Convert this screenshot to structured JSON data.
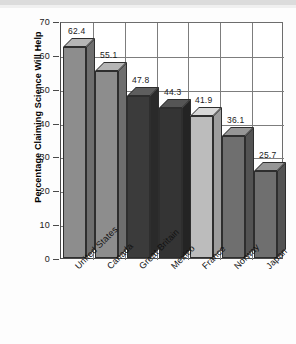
{
  "chart_data": {
    "type": "bar",
    "title": "",
    "xlabel": "",
    "ylabel": "Percentage  Claiming Science Will Help",
    "categories": [
      "United States",
      "Canada",
      "Great Britain",
      "Mexico",
      "France",
      "Norway",
      "Japan"
    ],
    "values": [
      62.4,
      55.1,
      47.8,
      44.3,
      41.9,
      36.1,
      25.7
    ],
    "value_labels": [
      "62.4",
      "55.1",
      "47.8",
      "44.3",
      "41.9",
      "36.1",
      "25.7"
    ],
    "ylim": [
      0,
      70
    ],
    "ytick_labels": [
      "0",
      "10",
      "20",
      "30",
      "40",
      "50",
      "60",
      "70"
    ],
    "ytick_values": [
      0,
      10,
      20,
      30,
      40,
      50,
      60,
      70
    ],
    "grid": "both",
    "legend": "none",
    "bar_colors": [
      "#8d8d8d",
      "#8d8d8d",
      "#3b3b3b",
      "#343434",
      "#bcbcbc",
      "#6f6f6f",
      "#6f6f6f"
    ],
    "bar_top_colors": [
      "#b5b5b5",
      "#b5b5b5",
      "#5e5e5e",
      "#555555",
      "#d8d8d8",
      "#969696",
      "#969696"
    ],
    "bar_side_colors": [
      "#6e6e6e",
      "#6e6e6e",
      "#2a2a2a",
      "#242424",
      "#9d9d9d",
      "#535353",
      "#535353"
    ]
  }
}
